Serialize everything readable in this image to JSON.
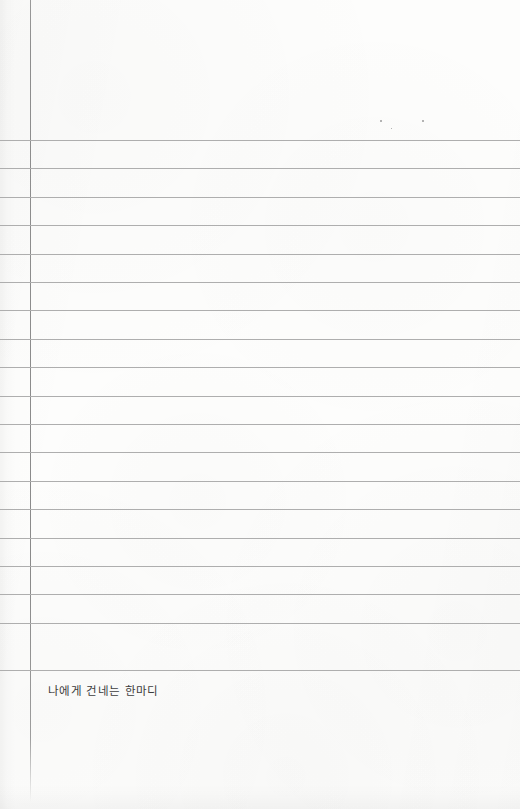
{
  "page": {
    "kind": "lined-notebook-page",
    "width": 520,
    "height": 809,
    "paper_color": "#fdfdfc"
  },
  "rules": {
    "margin_rule": {
      "orientation": "vertical",
      "x": 30,
      "color": "#8e8e8e"
    },
    "horizontal": {
      "color": "#aeaeae",
      "first_y": 140,
      "spacing": 28.4,
      "count": 19,
      "y_positions": [
        140,
        168,
        197,
        225,
        254,
        282,
        310,
        339,
        367,
        396,
        424,
        452,
        481,
        509,
        538,
        566,
        594,
        623,
        670
      ]
    }
  },
  "content": {
    "entry_label": "나에게 건네는 한마디"
  },
  "artifacts": {
    "specks": [
      {
        "x": 380,
        "y": 120,
        "size": 2
      },
      {
        "x": 422,
        "y": 120,
        "size": 2
      },
      {
        "x": 391,
        "y": 128,
        "size": 1
      }
    ]
  }
}
